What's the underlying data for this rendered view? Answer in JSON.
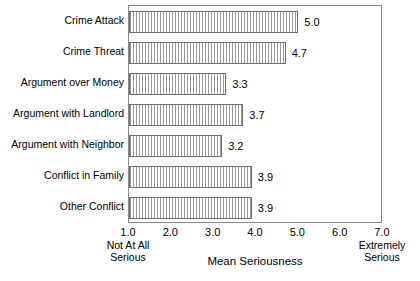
{
  "chart_data": {
    "type": "bar",
    "orientation": "horizontal",
    "title": "",
    "xlabel": "Mean Seriousness",
    "ylabel": "",
    "xlim": [
      1.0,
      7.0
    ],
    "xticks": [
      "1.0",
      "2.0",
      "3.0",
      "4.0",
      "5.0",
      "6.0",
      "7.0"
    ],
    "xtick_values": [
      1.0,
      2.0,
      3.0,
      4.0,
      5.0,
      6.0,
      7.0
    ],
    "grid": false,
    "legend": null,
    "axis_endpoint_labels": {
      "left": "Not At All Serious",
      "left_line1": "Not At All",
      "left_line2": "Serious",
      "right": "Extremely Serious",
      "right_line1": "Extremely",
      "right_line2": "Serious"
    },
    "categories": [
      "Crime Attack",
      "Crime Threat",
      "Argument over Money",
      "Argument with Landlord",
      "Argument with Neighbor",
      "Conflict in Family",
      "Other Conflict"
    ],
    "values": [
      5.0,
      4.7,
      3.3,
      3.7,
      3.2,
      3.9,
      3.9
    ],
    "value_labels": [
      "5.0",
      "4.7",
      "3.3",
      "3.7",
      "3.2",
      "3.9",
      "3.9"
    ],
    "bar_style": {
      "fill": "vertical-hatch",
      "hatch_color": "#9a9a9a",
      "background": "#ffffff",
      "edge_color": "#6d6d6d"
    },
    "frame_color": "#8a8a8a"
  }
}
